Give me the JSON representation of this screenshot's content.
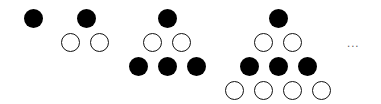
{
  "diagram": {
    "colors": {
      "black": "#000000",
      "white": "#ffffff",
      "outline": "#111111"
    },
    "dot_radius": 9.5,
    "figures": [
      {
        "index": 1,
        "rows": [
          {
            "color": "black",
            "centers": [
              [
                33,
                18
              ]
            ]
          }
        ]
      },
      {
        "index": 2,
        "rows": [
          {
            "color": "black",
            "centers": [
              [
                86,
                18
              ]
            ]
          },
          {
            "color": "white",
            "centers": [
              [
                70,
                42
              ],
              [
                99,
                42
              ]
            ]
          }
        ]
      },
      {
        "index": 3,
        "rows": [
          {
            "color": "black",
            "centers": [
              [
                167,
                18
              ]
            ]
          },
          {
            "color": "white",
            "centers": [
              [
                152,
                42
              ],
              [
                181,
                42
              ]
            ]
          },
          {
            "color": "black",
            "centers": [
              [
                138,
                66
              ],
              [
                167,
                66
              ],
              [
                196,
                66
              ]
            ]
          }
        ]
      },
      {
        "index": 4,
        "rows": [
          {
            "color": "black",
            "centers": [
              [
                278,
                18
              ]
            ]
          },
          {
            "color": "white",
            "centers": [
              [
                263,
                42
              ],
              [
                292,
                42
              ]
            ]
          },
          {
            "color": "black",
            "centers": [
              [
                249,
                66
              ],
              [
                278,
                66
              ],
              [
                307,
                66
              ]
            ]
          },
          {
            "color": "white",
            "centers": [
              [
                234,
                90
              ],
              [
                263,
                90
              ],
              [
                292,
                90
              ],
              [
                321,
                90
              ]
            ]
          }
        ]
      }
    ],
    "ellipsis": "..."
  }
}
